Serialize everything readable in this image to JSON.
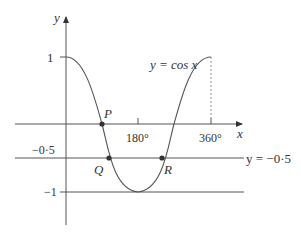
{
  "diagram": {
    "axes": {
      "x_label": "x",
      "y_label": "y",
      "x_ticks": [
        {
          "value": 180,
          "label": "180°"
        },
        {
          "value": 360,
          "label": "360°"
        }
      ],
      "y_ticks": [
        {
          "value": 1,
          "label": "1"
        },
        {
          "value": -0.5,
          "label": "−0·5"
        },
        {
          "value": -1,
          "label": "−1"
        }
      ]
    },
    "curve": {
      "equation_label": "y = cos x",
      "function": "cos x",
      "domain": [
        0,
        360
      ]
    },
    "horizontal_line": {
      "equation_label": "y = −0·5",
      "y": -0.5
    },
    "points": [
      {
        "name": "P",
        "x": 90,
        "y": 0
      },
      {
        "name": "Q",
        "x": 120,
        "y": -0.5
      },
      {
        "name": "R",
        "x": 240,
        "y": -0.5
      }
    ],
    "colors": {
      "stroke": "#555555",
      "text": "#333333",
      "point": "#333333"
    }
  }
}
